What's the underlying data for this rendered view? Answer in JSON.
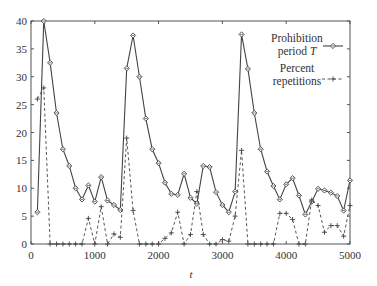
{
  "chart_data": {
    "type": "line",
    "title": "",
    "xlabel": "t",
    "ylabel": "",
    "xlim": [
      0,
      5000
    ],
    "ylim": [
      0,
      40
    ],
    "x_ticks": [
      0,
      1000,
      2000,
      3000,
      4000,
      5000
    ],
    "y_ticks": [
      0,
      5,
      10,
      15,
      20,
      25,
      30,
      35,
      40
    ],
    "grid": false,
    "legend_position": "upper right (inside)",
    "x": [
      100,
      200,
      300,
      400,
      500,
      600,
      700,
      800,
      900,
      1000,
      1100,
      1200,
      1300,
      1400,
      1500,
      1600,
      1700,
      1800,
      1900,
      2000,
      2100,
      2200,
      2300,
      2400,
      2500,
      2600,
      2700,
      2800,
      2900,
      3000,
      3100,
      3200,
      3300,
      3400,
      3500,
      3600,
      3700,
      3800,
      3900,
      4000,
      4100,
      4200,
      4300,
      4400,
      4500,
      4600,
      4700,
      4800,
      4900,
      5000
    ],
    "series": [
      {
        "name": "Prohibition period T",
        "legend_line1": "Prohibition",
        "legend_line2": "period T",
        "style": "solid",
        "marker": "diamond",
        "color": "#444444",
        "values": [
          5.7,
          40,
          32.5,
          23.5,
          17,
          14,
          10,
          8,
          10.5,
          7.6,
          12,
          7.8,
          7,
          6.1,
          31.5,
          37.4,
          30,
          22.5,
          17,
          14.5,
          11,
          9,
          8.8,
          12.6,
          8.3,
          7.2,
          14,
          13.8,
          9.3,
          7,
          5.7,
          9.4,
          37.6,
          31.4,
          23.5,
          17,
          13,
          10.4,
          8,
          10.7,
          11.8,
          8.7,
          5.3,
          7.6,
          9.9,
          9.6,
          9.2,
          8.6,
          6,
          11.4
        ]
      },
      {
        "name": "Percent repetitions",
        "legend_line1": "Percent",
        "legend_line2": "repetitions",
        "style": "dashed",
        "marker": "plus",
        "color": "#444444",
        "values": [
          26,
          28,
          0,
          0,
          0,
          0,
          0,
          0,
          4.6,
          0,
          6.7,
          0,
          1.8,
          1.2,
          19,
          6,
          0,
          0,
          0,
          0,
          1,
          2,
          5.7,
          0,
          1.7,
          9.4,
          1.7,
          0,
          0,
          0.8,
          0.5,
          5,
          16.8,
          0,
          0,
          0,
          0,
          0,
          5.5,
          5.5,
          4.4,
          0,
          0,
          7.9,
          6.9,
          2.1,
          3.3,
          3.3,
          1.4,
          6.9
        ]
      }
    ]
  }
}
